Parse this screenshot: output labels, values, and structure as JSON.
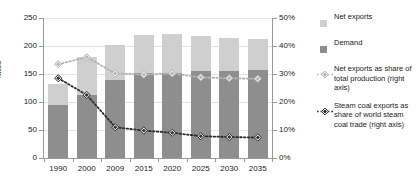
{
  "chart_data": {
    "type": "bar",
    "title": "",
    "subtitle": "",
    "xlabel": "",
    "ylabel": "Mtce",
    "ylabel_right": "",
    "categories": [
      "1990",
      "2000",
      "2009",
      "2015",
      "2020",
      "2025",
      "2030",
      "2035"
    ],
    "ylim": [
      0,
      250
    ],
    "yticks": [
      0,
      50,
      100,
      150,
      200,
      250
    ],
    "ytick_labels": [
      "0",
      "50",
      "100",
      "150",
      "200",
      "250"
    ],
    "ylim_right": [
      0,
      50
    ],
    "yticks_right": [
      0,
      10,
      20,
      30,
      40,
      50
    ],
    "ytick_labels_right": [
      "0%",
      "10%",
      "20%",
      "30%",
      "40%",
      "50%"
    ],
    "grid": true,
    "legend_position": "right",
    "stacked": true,
    "series": [
      {
        "name": "Demand",
        "type": "bar",
        "axis": "left",
        "color": "#8e8e8e",
        "values": [
          94,
          112,
          140,
          152,
          152,
          155,
          155,
          158
        ]
      },
      {
        "name": "Net exports",
        "type": "bar",
        "axis": "left",
        "color": "#cfcfcf",
        "values": [
          39,
          68,
          62,
          68,
          70,
          62,
          60,
          54
        ]
      },
      {
        "name": "Net exports as share of total production (right axis)",
        "type": "line",
        "axis": "right",
        "color": "#b4b4b4",
        "marker": "diamond",
        "linestyle": "dotted",
        "values": [
          33.5,
          36.0,
          30.2,
          29.8,
          30.2,
          28.8,
          28.5,
          28.3
        ]
      },
      {
        "name": "Steam coal exports as share of world steam coal trade (right axis)",
        "type": "line",
        "axis": "right",
        "color": "#2b2b2b",
        "marker": "diamond",
        "linestyle": "dotted",
        "values": [
          28.5,
          22.5,
          11.0,
          9.8,
          9.0,
          7.8,
          7.5,
          7.3
        ]
      }
    ]
  },
  "legend": {
    "items": [
      {
        "label": "Net exports",
        "kind": "swatch",
        "color": "#cfcfcf"
      },
      {
        "label": "Demand",
        "kind": "swatch",
        "color": "#8e8e8e"
      },
      {
        "label": "Net exports as share of total production (right axis)",
        "kind": "line-marker",
        "color": "#b4b4b4"
      },
      {
        "label": "Steam coal exports as share of world steam coal trade (right axis)",
        "kind": "line-marker",
        "color": "#2b2b2b"
      }
    ]
  }
}
